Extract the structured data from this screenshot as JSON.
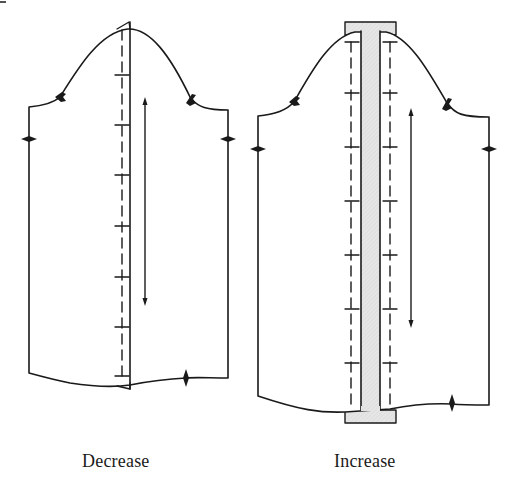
{
  "figure": {
    "type": "sleeve pattern adjustment diagram",
    "panels": [
      {
        "id": "decrease",
        "caption": "Decrease",
        "description": "Sleeve pattern folded along a vertical line to reduce width; dashed fold line with cross marks, grain arrow, notches at cap and underarm."
      },
      {
        "id": "increase",
        "caption": "Increase",
        "description": "Sleeve pattern slashed vertically and spread with a shaded insert strip extended above the cap and below the hem; dashed lines with cross marks on both sides, grain arrow, notches."
      }
    ]
  },
  "colors": {
    "line": "#1a1a1a",
    "insert_fill": "#e4e4e4",
    "background": "#ffffff"
  }
}
